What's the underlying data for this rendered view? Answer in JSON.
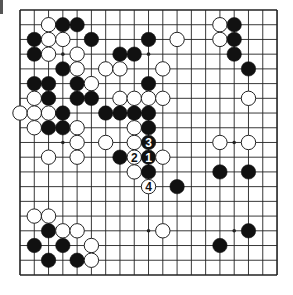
{
  "board": {
    "size": 19,
    "origin_x": 20,
    "origin_y": 10,
    "step_x": 14.28,
    "step_y": 14.72,
    "stone_radius": 7.2,
    "line_color": "#222222",
    "border_width": 1.6,
    "black_color": "#111111",
    "white_fill": "#ffffff",
    "white_stroke": "#222222",
    "star_points": [
      [
        3,
        3
      ],
      [
        3,
        9
      ],
      [
        3,
        15
      ],
      [
        9,
        3
      ],
      [
        9,
        9
      ],
      [
        9,
        15
      ],
      [
        15,
        3
      ],
      [
        15,
        9
      ],
      [
        15,
        15
      ]
    ]
  },
  "stones": [
    {
      "c": 2,
      "r": 1,
      "color": "white"
    },
    {
      "c": 3,
      "r": 1,
      "color": "black"
    },
    {
      "c": 4,
      "r": 1,
      "color": "black"
    },
    {
      "c": 14,
      "r": 1,
      "color": "white"
    },
    {
      "c": 15,
      "r": 1,
      "color": "black"
    },
    {
      "c": 1,
      "r": 2,
      "color": "black"
    },
    {
      "c": 2,
      "r": 2,
      "color": "white"
    },
    {
      "c": 3,
      "r": 2,
      "color": "white"
    },
    {
      "c": 5,
      "r": 2,
      "color": "black"
    },
    {
      "c": 9,
      "r": 2,
      "color": "black"
    },
    {
      "c": 11,
      "r": 2,
      "color": "white"
    },
    {
      "c": 14,
      "r": 2,
      "color": "white"
    },
    {
      "c": 15,
      "r": 2,
      "color": "black"
    },
    {
      "c": 1,
      "r": 3,
      "color": "black"
    },
    {
      "c": 2,
      "r": 3,
      "color": "white"
    },
    {
      "c": 4,
      "r": 3,
      "color": "white"
    },
    {
      "c": 7,
      "r": 3,
      "color": "black"
    },
    {
      "c": 8,
      "r": 3,
      "color": "black"
    },
    {
      "c": 15,
      "r": 3,
      "color": "black"
    },
    {
      "c": 3,
      "r": 4,
      "color": "black"
    },
    {
      "c": 4,
      "r": 4,
      "color": "white"
    },
    {
      "c": 6,
      "r": 4,
      "color": "white"
    },
    {
      "c": 7,
      "r": 4,
      "color": "white"
    },
    {
      "c": 10,
      "r": 4,
      "color": "white"
    },
    {
      "c": 16,
      "r": 4,
      "color": "black"
    },
    {
      "c": 1,
      "r": 5,
      "color": "black"
    },
    {
      "c": 2,
      "r": 5,
      "color": "black"
    },
    {
      "c": 4,
      "r": 5,
      "color": "black"
    },
    {
      "c": 5,
      "r": 5,
      "color": "white"
    },
    {
      "c": 9,
      "r": 5,
      "color": "black"
    },
    {
      "c": 1,
      "r": 6,
      "color": "white"
    },
    {
      "c": 2,
      "r": 6,
      "color": "black"
    },
    {
      "c": 4,
      "r": 6,
      "color": "black"
    },
    {
      "c": 5,
      "r": 6,
      "color": "black"
    },
    {
      "c": 7,
      "r": 6,
      "color": "white"
    },
    {
      "c": 8,
      "r": 6,
      "color": "white"
    },
    {
      "c": 9,
      "r": 6,
      "color": "white"
    },
    {
      "c": 10,
      "r": 6,
      "color": "white"
    },
    {
      "c": 16,
      "r": 6,
      "color": "white"
    },
    {
      "c": 0,
      "r": 7,
      "color": "white"
    },
    {
      "c": 1,
      "r": 7,
      "color": "white"
    },
    {
      "c": 2,
      "r": 7,
      "color": "white"
    },
    {
      "c": 3,
      "r": 7,
      "color": "black"
    },
    {
      "c": 6,
      "r": 7,
      "color": "black"
    },
    {
      "c": 7,
      "r": 7,
      "color": "black"
    },
    {
      "c": 8,
      "r": 7,
      "color": "black"
    },
    {
      "c": 9,
      "r": 7,
      "color": "black"
    },
    {
      "c": 1,
      "r": 8,
      "color": "white"
    },
    {
      "c": 2,
      "r": 8,
      "color": "black"
    },
    {
      "c": 3,
      "r": 8,
      "color": "black"
    },
    {
      "c": 4,
      "r": 8,
      "color": "white"
    },
    {
      "c": 8,
      "r": 8,
      "color": "white"
    },
    {
      "c": 9,
      "r": 8,
      "color": "black"
    },
    {
      "c": 4,
      "r": 9,
      "color": "white"
    },
    {
      "c": 6,
      "r": 9,
      "color": "white"
    },
    {
      "c": 8,
      "r": 9,
      "color": "white"
    },
    {
      "c": 9,
      "r": 9,
      "color": "black",
      "label": "3"
    },
    {
      "c": 14,
      "r": 9,
      "color": "white"
    },
    {
      "c": 16,
      "r": 9,
      "color": "white"
    },
    {
      "c": 2,
      "r": 10,
      "color": "white"
    },
    {
      "c": 4,
      "r": 10,
      "color": "white"
    },
    {
      "c": 7,
      "r": 10,
      "color": "black"
    },
    {
      "c": 8,
      "r": 10,
      "color": "white",
      "label": "2"
    },
    {
      "c": 9,
      "r": 10,
      "color": "black",
      "label": "1"
    },
    {
      "c": 10,
      "r": 10,
      "color": "white"
    },
    {
      "c": 8,
      "r": 11,
      "color": "white"
    },
    {
      "c": 9,
      "r": 11,
      "color": "black"
    },
    {
      "c": 14,
      "r": 11,
      "color": "black"
    },
    {
      "c": 16,
      "r": 11,
      "color": "black"
    },
    {
      "c": 9,
      "r": 12,
      "color": "white",
      "label": "4"
    },
    {
      "c": 11,
      "r": 12,
      "color": "black"
    },
    {
      "c": 1,
      "r": 14,
      "color": "white"
    },
    {
      "c": 2,
      "r": 14,
      "color": "white"
    },
    {
      "c": 2,
      "r": 15,
      "color": "black"
    },
    {
      "c": 3,
      "r": 15,
      "color": "white"
    },
    {
      "c": 4,
      "r": 15,
      "color": "white"
    },
    {
      "c": 10,
      "r": 15,
      "color": "white"
    },
    {
      "c": 16,
      "r": 15,
      "color": "black"
    },
    {
      "c": 1,
      "r": 16,
      "color": "black"
    },
    {
      "c": 3,
      "r": 16,
      "color": "black"
    },
    {
      "c": 5,
      "r": 16,
      "color": "white"
    },
    {
      "c": 14,
      "r": 16,
      "color": "black"
    },
    {
      "c": 2,
      "r": 17,
      "color": "black"
    },
    {
      "c": 4,
      "r": 17,
      "color": "black"
    },
    {
      "c": 5,
      "r": 17,
      "color": "white"
    }
  ],
  "move_labels": [
    "1",
    "2",
    "3",
    "4"
  ]
}
